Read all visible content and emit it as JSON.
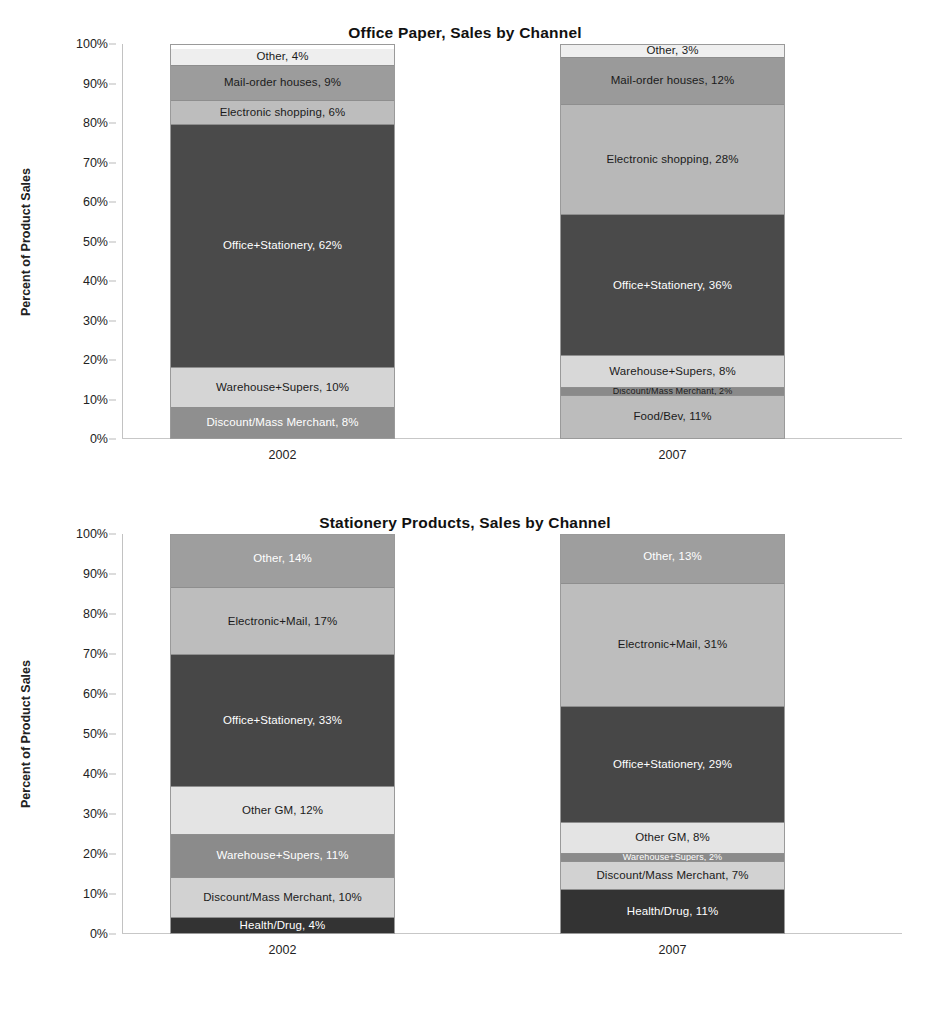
{
  "figure": {
    "caption": ""
  },
  "charts": [
    {
      "id": "office-paper",
      "title": "Office Paper, Sales by Channel",
      "ylabel": "Percent of  Product Sales",
      "yticks": [
        "0%",
        "10%",
        "20%",
        "30%",
        "40%",
        "50%",
        "60%",
        "70%",
        "80%",
        "90%",
        "100%"
      ],
      "categories": [
        "2002",
        "2007"
      ]
    },
    {
      "id": "stationery-products",
      "title": "Stationery Products, Sales by Channel",
      "ylabel": "Percent of Product Sales",
      "yticks": [
        "0%",
        "10%",
        "20%",
        "30%",
        "40%",
        "50%",
        "60%",
        "70%",
        "80%",
        "90%",
        "100%"
      ],
      "categories": [
        "2002",
        "2007"
      ]
    }
  ],
  "chart_data": [
    {
      "type": "bar",
      "stacked": true,
      "title": "Office Paper, Sales by Channel",
      "xlabel": "",
      "ylabel": "Percent of  Product Sales",
      "ylim": [
        0,
        100
      ],
      "grid": false,
      "legend": "none",
      "categories": [
        "2002",
        "2007"
      ],
      "series": [
        {
          "name": "Food/Bev",
          "values": [
            0,
            11
          ],
          "color": "#a8a8a8"
        },
        {
          "name": "Discount/Mass Merchant",
          "values": [
            8,
            2
          ],
          "color": "#8f8f8f"
        },
        {
          "name": "Warehouse+Supers",
          "values": [
            10,
            8
          ],
          "color": "#d5d5d5"
        },
        {
          "name": "Office+Stationery",
          "values": [
            62,
            36
          ],
          "color": "#4a4a4a"
        },
        {
          "name": "Electronic shopping",
          "values": [
            6,
            28
          ],
          "color": "#bdbdbd"
        },
        {
          "name": "Mail-order houses",
          "values": [
            9,
            12
          ],
          "color": "#9c9c9c"
        },
        {
          "name": "Other",
          "values": [
            4,
            3
          ],
          "color": "#eeeeee"
        }
      ],
      "bars": [
        {
          "category": "2002",
          "segments": [
            {
              "label": "Discount/Mass Merchant, 8%",
              "name": "Discount/Mass Merchant",
              "value": 8,
              "color": "#8f8f8f",
              "text": "dark"
            },
            {
              "label": "Warehouse+Supers, 10%",
              "name": "Warehouse+Supers",
              "value": 10,
              "color": "#d5d5d5",
              "text": "light",
              "wrap": true
            },
            {
              "label": "Office+Stationery, 62%",
              "name": "Office+Stationery",
              "value": 62,
              "color": "#4a4a4a",
              "text": "dark"
            },
            {
              "label": "Electronic shopping, 6%",
              "name": "Electronic shopping",
              "value": 6,
              "color": "#bdbdbd",
              "text": "light"
            },
            {
              "label": "Mail-order houses, 9%",
              "name": "Mail-order houses",
              "value": 9,
              "color": "#9c9c9c",
              "text": "light"
            },
            {
              "label": "Other, 4%",
              "name": "Other",
              "value": 4,
              "color": "#eeeeee",
              "text": "light"
            }
          ]
        },
        {
          "category": "2007",
          "segments": [
            {
              "label": "Food/Bev, 11%",
              "name": "Food/Bev",
              "value": 11,
              "color": "#bcbcbc",
              "text": "light"
            },
            {
              "label": "Discount/Mass Merchant, 2%",
              "name": "Discount/Mass Merchant",
              "value": 2,
              "color": "#8a8a8a",
              "text": "light",
              "tiny": true
            },
            {
              "label": "Warehouse+Supers, 8%",
              "name": "Warehouse+Supers",
              "value": 8,
              "color": "#d8d8d8",
              "text": "light"
            },
            {
              "label": "Office+Stationery, 36%",
              "name": "Office+Stationery",
              "value": 36,
              "color": "#4a4a4a",
              "text": "dark"
            },
            {
              "label": "Electronic shopping, 28%",
              "name": "Electronic shopping",
              "value": 28,
              "color": "#b8b8b8",
              "text": "light"
            },
            {
              "label": "Mail-order houses, 12%",
              "name": "Mail-order houses",
              "value": 12,
              "color": "#9a9a9a",
              "text": "light"
            },
            {
              "label": "Other, 3%",
              "name": "Other",
              "value": 3,
              "color": "#efefef",
              "text": "light"
            }
          ]
        }
      ]
    },
    {
      "type": "bar",
      "stacked": true,
      "title": "Stationery Products, Sales by Channel",
      "xlabel": "",
      "ylabel": "Percent of Product Sales",
      "ylim": [
        0,
        100
      ],
      "grid": false,
      "legend": "none",
      "categories": [
        "2002",
        "2007"
      ],
      "series": [
        {
          "name": "Health/Drug",
          "values": [
            4,
            11
          ],
          "color": "#3a3a3a"
        },
        {
          "name": "Discount/Mass Merchant",
          "values": [
            10,
            7
          ],
          "color": "#d2d2d2"
        },
        {
          "name": "Warehouse+Supers",
          "values": [
            11,
            2
          ],
          "color": "#8b8b8b"
        },
        {
          "name": "Other GM",
          "values": [
            12,
            8
          ],
          "color": "#e2e2e2"
        },
        {
          "name": "Office+Stationery",
          "values": [
            33,
            29
          ],
          "color": "#474747"
        },
        {
          "name": "Electronic+Mail",
          "values": [
            17,
            31
          ],
          "color": "#bdbdbd"
        },
        {
          "name": "Other",
          "values": [
            14,
            13
          ],
          "color": "#9e9e9e"
        }
      ],
      "bars": [
        {
          "category": "2002",
          "segments": [
            {
              "label": "Health/Drug, 4%",
              "name": "Health/Drug",
              "value": 4,
              "color": "#333333",
              "text": "dark"
            },
            {
              "label": "Discount/Mass Merchant, 10%",
              "name": "Discount/Mass Merchant",
              "value": 10,
              "color": "#d2d2d2",
              "text": "light"
            },
            {
              "label": "Warehouse+Supers, 11%",
              "name": "Warehouse+Supers",
              "value": 11,
              "color": "#8b8b8b",
              "text": "dark",
              "wrap": true
            },
            {
              "label": "Other GM, 12%",
              "name": "Other GM",
              "value": 12,
              "color": "#e4e4e4",
              "text": "light"
            },
            {
              "label": "Office+Stationery, 33%",
              "name": "Office+Stationery",
              "value": 33,
              "color": "#474747",
              "text": "dark"
            },
            {
              "label": "Electronic+Mail, 17%",
              "name": "Electronic+Mail",
              "value": 17,
              "color": "#bdbdbd",
              "text": "light"
            },
            {
              "label": "Other, 14%",
              "name": "Other",
              "value": 14,
              "color": "#9e9e9e",
              "text": "dark"
            }
          ]
        },
        {
          "category": "2007",
          "segments": [
            {
              "label": "Health/Drug, 11%",
              "name": "Health/Drug",
              "value": 11,
              "color": "#333333",
              "text": "dark"
            },
            {
              "label": "Discount/Mass Merchant, 7%",
              "name": "Discount/Mass Merchant",
              "value": 7,
              "color": "#d2d2d2",
              "text": "light"
            },
            {
              "label": "Warehouse+Supers, 2%",
              "name": "Warehouse+Supers",
              "value": 2,
              "color": "#8b8b8b",
              "text": "dark",
              "tiny": true
            },
            {
              "label": "Other GM, 8%",
              "name": "Other GM",
              "value": 8,
              "color": "#e4e4e4",
              "text": "light"
            },
            {
              "label": "Office+Stationery, 29%",
              "name": "Office+Stationery",
              "value": 29,
              "color": "#474747",
              "text": "dark"
            },
            {
              "label": "Electronic+Mail, 31%",
              "name": "Electronic+Mail",
              "value": 31,
              "color": "#bdbdbd",
              "text": "light"
            },
            {
              "label": "Other, 13%",
              "name": "Other",
              "value": 13,
              "color": "#9e9e9e",
              "text": "dark"
            }
          ]
        }
      ]
    }
  ]
}
